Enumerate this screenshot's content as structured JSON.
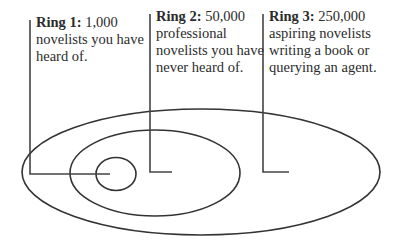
{
  "diagram": {
    "type": "nested-ellipses",
    "rings": [
      {
        "title": "Ring 1:",
        "count": "1,000",
        "description": "novelists you have heard of."
      },
      {
        "title": "Ring 2:",
        "count": "50,000",
        "description": "professional novelists you have never heard of."
      },
      {
        "title": "Ring 3:",
        "count": "250,000",
        "description": "aspiring novelists writing a book or querying an agent."
      }
    ],
    "stroke_color": "#333333"
  }
}
